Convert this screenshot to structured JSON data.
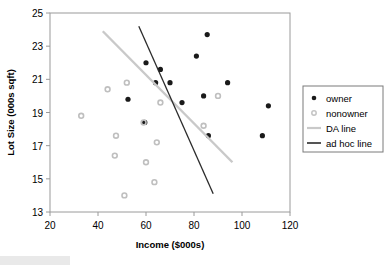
{
  "chart_data": {
    "type": "scatter",
    "title": "",
    "xlabel": "Income ($000s)",
    "ylabel": "Lot Size (000s sqft)",
    "xlim": [
      20,
      120
    ],
    "ylim": [
      13,
      25
    ],
    "xticks": [
      20,
      40,
      60,
      80,
      100,
      120
    ],
    "yticks": [
      13,
      15,
      17,
      19,
      21,
      23,
      25
    ],
    "grid": false,
    "legend_position": "right",
    "series": [
      {
        "name": "owner",
        "marker": "filled-circle",
        "color": "#1a1a1a",
        "points": [
          {
            "x": 60.0,
            "y": 22.0
          },
          {
            "x": 85.5,
            "y": 23.7
          },
          {
            "x": 66.0,
            "y": 21.6
          },
          {
            "x": 70.0,
            "y": 20.8
          },
          {
            "x": 64.0,
            "y": 20.8
          },
          {
            "x": 81.0,
            "y": 22.4
          },
          {
            "x": 59.5,
            "y": 18.4
          },
          {
            "x": 75.0,
            "y": 19.6
          },
          {
            "x": 84.0,
            "y": 20.0
          },
          {
            "x": 94.0,
            "y": 20.8
          },
          {
            "x": 108.5,
            "y": 17.6
          },
          {
            "x": 111.0,
            "y": 19.4
          },
          {
            "x": 86.0,
            "y": 17.6
          },
          {
            "x": 52.5,
            "y": 19.8
          }
        ]
      },
      {
        "name": "nonowner",
        "marker": "open-circle",
        "color": "#bfbfbf",
        "points": [
          {
            "x": 33.0,
            "y": 18.8
          },
          {
            "x": 44.0,
            "y": 20.4
          },
          {
            "x": 52.0,
            "y": 20.8
          },
          {
            "x": 59.0,
            "y": 18.4
          },
          {
            "x": 66.0,
            "y": 19.6
          },
          {
            "x": 90.0,
            "y": 20.0
          },
          {
            "x": 47.5,
            "y": 17.6
          },
          {
            "x": 47.0,
            "y": 16.4
          },
          {
            "x": 60.0,
            "y": 16.0
          },
          {
            "x": 64.5,
            "y": 17.2
          },
          {
            "x": 63.5,
            "y": 14.8
          },
          {
            "x": 51.0,
            "y": 14.0
          },
          {
            "x": 84.0,
            "y": 18.2
          }
        ]
      }
    ],
    "lines": [
      {
        "name": "DA line",
        "color": "#c9c9c9",
        "x1": 42.0,
        "y1": 23.9,
        "x2": 96.0,
        "y2": 16.0
      },
      {
        "name": "ad hoc line",
        "color": "#2b2b2b",
        "x1": 57.0,
        "y1": 24.2,
        "x2": 88.0,
        "y2": 14.1
      }
    ],
    "legend": [
      {
        "label": "owner",
        "type": "marker",
        "marker": "filled-circle",
        "color": "#1a1a1a"
      },
      {
        "label": "nonowner",
        "type": "marker",
        "marker": "open-circle",
        "color": "#c4c4c4"
      },
      {
        "label": "DA line",
        "type": "line",
        "color": "#c9c9c9"
      },
      {
        "label": "ad hoc line",
        "type": "line",
        "color": "#2b2b2b"
      }
    ]
  }
}
